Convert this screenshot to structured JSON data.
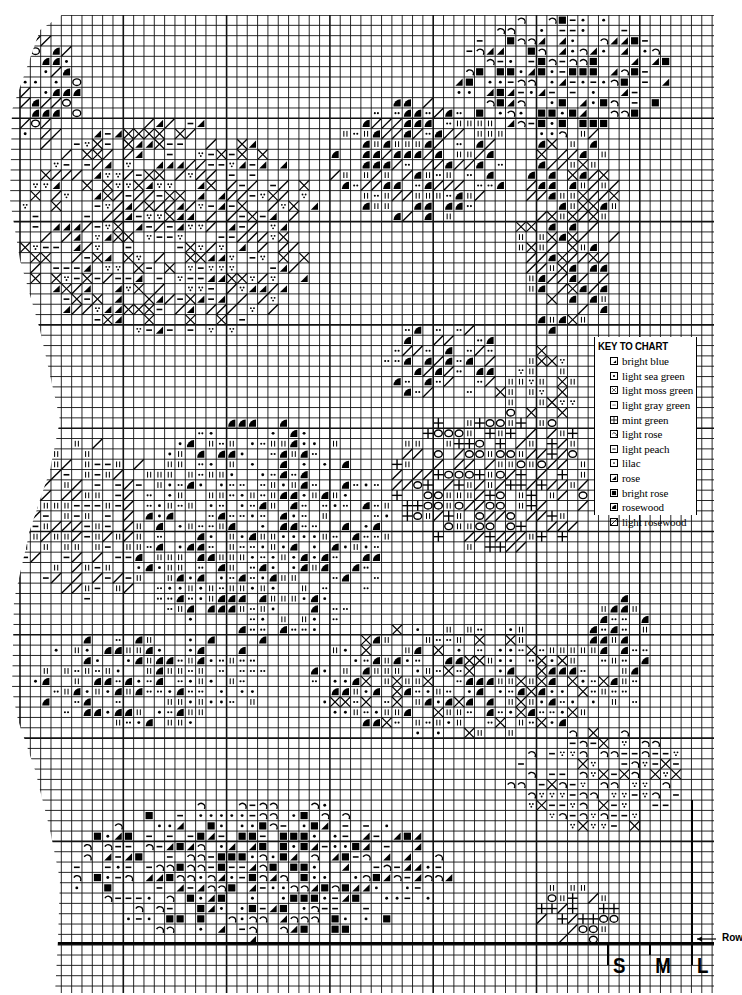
{
  "chart": {
    "grid": {
      "left": 20,
      "top": 15,
      "right": 714,
      "bottom": 993,
      "cell": 10.33,
      "thick_every": 10,
      "line_color": "#000000"
    },
    "left_boundary": [
      [
        62,
        15
      ],
      [
        40,
        30
      ],
      [
        12,
        110
      ],
      [
        10,
        200
      ],
      [
        20,
        260
      ],
      [
        40,
        330
      ],
      [
        60,
        420
      ],
      [
        50,
        470
      ],
      [
        30,
        530
      ],
      [
        14,
        600
      ],
      [
        12,
        690
      ],
      [
        18,
        720
      ],
      [
        35,
        770
      ],
      [
        50,
        830
      ],
      [
        60,
        880
      ],
      [
        58,
        940
      ],
      [
        55,
        993
      ]
    ],
    "key": {
      "title": "KEY TO CHART",
      "items": [
        {
          "symbol": "bright-blue-symbol",
          "glyph": "corner",
          "label": "bright blue"
        },
        {
          "symbol": "light-sea-green-symbol",
          "glyph": "dot-box",
          "label": "light sea green"
        },
        {
          "symbol": "light-moss-green-symbol",
          "glyph": "x-dots",
          "label": "light moss green"
        },
        {
          "symbol": "light-gray-green-symbol",
          "glyph": "double-dot",
          "label": "light gray green"
        },
        {
          "symbol": "mint-green-symbol",
          "glyph": "plus",
          "label": "mint green"
        },
        {
          "symbol": "light-rose-symbol",
          "glyph": "arc",
          "label": "light rose"
        },
        {
          "symbol": "light-peach-symbol",
          "glyph": "dash",
          "label": "light peach"
        },
        {
          "symbol": "lilac-symbol",
          "glyph": "dot",
          "label": "lilac"
        },
        {
          "symbol": "rose-symbol",
          "glyph": "half-tri",
          "label": "rose"
        },
        {
          "symbol": "bright-rose-symbol",
          "glyph": "solid",
          "label": "bright rose"
        },
        {
          "symbol": "rosewood-symbol",
          "glyph": "quarter",
          "label": "rosewood"
        },
        {
          "symbol": "light-rosewood-symbol",
          "glyph": "diag",
          "label": "light rosewood"
        }
      ]
    },
    "sizes": [
      {
        "label": "S",
        "x": 608,
        "line_top": 943,
        "line_bottom": 965
      },
      {
        "label": "M",
        "x": 650,
        "line_top": 943,
        "line_bottom": 955
      },
      {
        "label": "L",
        "x": 692,
        "line_top": 800,
        "line_bottom": 965
      }
    ],
    "row_marker": {
      "label": "Row",
      "y": 939
    },
    "baseline_y": 943,
    "motifs": [
      {
        "name": "rose-top-right",
        "cx": 560,
        "cy": 75,
        "rx": 110,
        "ry": 60,
        "glyphs": [
          "dash",
          "solid",
          "half-tri",
          "arc",
          "dot"
        ]
      },
      {
        "name": "leaf-top-left",
        "cx": 170,
        "cy": 230,
        "rx": 150,
        "ry": 110,
        "glyphs": [
          "dash",
          "v-dots",
          "cross",
          "half-tri",
          "diag"
        ]
      },
      {
        "name": "bud-top-left",
        "cx": 45,
        "cy": 90,
        "rx": 40,
        "ry": 55,
        "glyphs": [
          "quarter",
          "ring",
          "dot",
          "diag"
        ]
      },
      {
        "name": "leaf-top-middle",
        "cx": 420,
        "cy": 160,
        "rx": 90,
        "ry": 60,
        "glyphs": [
          "double-dot",
          "diag",
          "bars",
          "quarter"
        ]
      },
      {
        "name": "stem-right",
        "cx": 570,
        "cy": 230,
        "rx": 50,
        "ry": 110,
        "glyphs": [
          "bars",
          "quarter",
          "diag",
          "cross"
        ]
      },
      {
        "name": "leaf-middle-right",
        "cx": 500,
        "cy": 480,
        "rx": 110,
        "ry": 70,
        "glyphs": [
          "diag",
          "plus",
          "ring",
          "bars"
        ]
      },
      {
        "name": "rose-center",
        "cx": 260,
        "cy": 530,
        "rx": 130,
        "ry": 110,
        "glyphs": [
          "bars",
          "quarter",
          "double-dot",
          "dot"
        ]
      },
      {
        "name": "leaf-left",
        "cx": 90,
        "cy": 520,
        "rx": 75,
        "ry": 80,
        "glyphs": [
          "diag",
          "bars",
          "dash"
        ]
      },
      {
        "name": "rose-lower-center",
        "cx": 460,
        "cy": 680,
        "rx": 150,
        "ry": 60,
        "glyphs": [
          "bars",
          "dot",
          "quarter",
          "cross",
          "double-dot"
        ]
      },
      {
        "name": "leaf-lower-left",
        "cx": 150,
        "cy": 680,
        "rx": 120,
        "ry": 50,
        "glyphs": [
          "quarter",
          "bars",
          "double-dot",
          "dot"
        ]
      },
      {
        "name": "leaf-lower-right",
        "cx": 600,
        "cy": 780,
        "rx": 90,
        "ry": 50,
        "glyphs": [
          "v-dots",
          "cross",
          "dash",
          "arc"
        ]
      },
      {
        "name": "rose-bottom",
        "cx": 260,
        "cy": 870,
        "rx": 190,
        "ry": 70,
        "glyphs": [
          "half-tri",
          "dot",
          "dash",
          "arc",
          "solid"
        ]
      },
      {
        "name": "bud-bottom-right",
        "cx": 580,
        "cy": 910,
        "rx": 40,
        "ry": 35,
        "glyphs": [
          "ring",
          "bars",
          "diag",
          "plus"
        ]
      },
      {
        "name": "leaf-mid-small",
        "cx": 440,
        "cy": 360,
        "rx": 60,
        "ry": 40,
        "glyphs": [
          "quarter",
          "diag",
          "double-dot"
        ]
      },
      {
        "name": "leaf-right-small",
        "cx": 540,
        "cy": 390,
        "rx": 40,
        "ry": 40,
        "glyphs": [
          "cross",
          "bars",
          "v-dots"
        ]
      },
      {
        "name": "right-stem-lower",
        "cx": 620,
        "cy": 650,
        "rx": 30,
        "ry": 60,
        "glyphs": [
          "bars",
          "double-dot",
          "quarter"
        ]
      }
    ],
    "empty_zones": [
      {
        "x": 594,
        "y": 337,
        "w": 103,
        "h": 178
      }
    ]
  }
}
